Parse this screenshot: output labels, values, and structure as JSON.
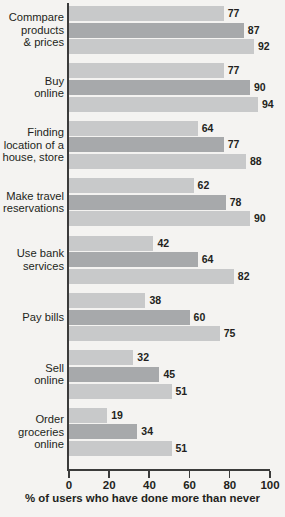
{
  "chart_data": {
    "type": "bar",
    "orientation": "horizontal",
    "title": "",
    "subtitle": "",
    "xlabel": "% of users who have done more than never",
    "ylabel": "",
    "xlim": [
      0,
      100
    ],
    "xticks": [
      0,
      20,
      40,
      60,
      80,
      100
    ],
    "xtick_labels": [
      "0",
      "20",
      "40",
      "60",
      "80",
      "100"
    ],
    "grid": false,
    "legend": null,
    "legend_position": "none",
    "categories": [
      "Commpare\nproducts\n& prices",
      "Buy\nonline",
      "Finding\nlocation of a\nhouse, store",
      "Make travel\nreservations",
      "Use bank\nservices",
      "Pay bills",
      "Sell\nonline",
      "Order\ngroceries\nonline"
    ],
    "series": [
      {
        "name": "series-1",
        "values": [
          77,
          77,
          64,
          62,
          42,
          38,
          32,
          19
        ]
      },
      {
        "name": "series-2",
        "values": [
          87,
          90,
          77,
          78,
          64,
          60,
          45,
          34
        ]
      },
      {
        "name": "series-3",
        "values": [
          92,
          94,
          88,
          90,
          82,
          75,
          51,
          51
        ]
      }
    ],
    "colors": {
      "series_1": "#c8c9ca",
      "series_2": "#a7a9ab",
      "series_3": "#c8c9ca",
      "axis": "#3b3b3b",
      "text": "#231f20",
      "background": "#f4f3f1"
    }
  }
}
